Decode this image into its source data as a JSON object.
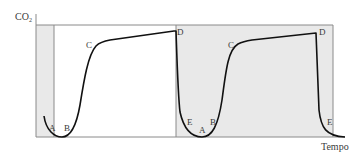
{
  "diagram": {
    "y_axis_label": "CO",
    "y_axis_subscript": "2",
    "x_axis_label": "Tempo",
    "colors": {
      "line": "#111111",
      "axis": "#8a8a8a",
      "shade": "#e9e9e9",
      "text": "#3a3a3a"
    },
    "phase_labels": {
      "cycle1": [
        "A",
        "B",
        "C",
        "D"
      ],
      "cycle2": [
        "E",
        "A",
        "B",
        "C",
        "D",
        "E"
      ]
    }
  }
}
